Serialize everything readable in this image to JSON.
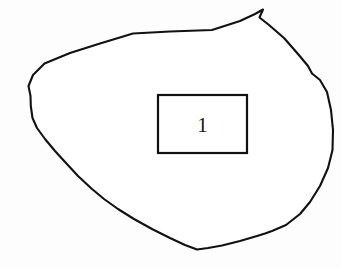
{
  "figure": {
    "kind": "hand-drawn-closed-outline-with-labelled-box",
    "background_color": "#fdfdfd",
    "stroke_color": "#111111",
    "fill_color": "#ffffff",
    "canvas": {
      "width": 341,
      "height": 268
    },
    "outline": {
      "name": "irregular-blob-outline",
      "stroke_width": 2.1,
      "closed": true,
      "description": "Irregular hand-drawn closed contour occupying most of the frame, with a sharp notch at the upper right",
      "path": "M 44.5 63.5 L 70 53 L 100 43.5 L 133 33.5 L 170 31.5 L 212 30 L 240 21 L 255 14 L 263 9.5 L 261 14 L 259.5 17.5 L 269 25 L 284 38 L 298 54 L 308 66 L 312 73.5 L 320 80 L 327 92 L 331 110 L 333 130 L 332.5 150 L 328 168 L 320 186 L 310 202 L 300 214 L 286 225 L 272 231 L 265 233.5 L 257 236 L 240 241 L 222 245.5 L 208 248 L 197 249.5 L 185 245 L 170 238 L 152 229 L 134 219 L 118 209 L 104 199 L 92 189 L 78 176 L 66 163 L 55 151 L 45 139 L 37 128 L 32.5 118 L 30.8 106 L 30.5 96 L 28.5 86 L 33 75 Z"
    },
    "callout_box": {
      "name": "numbered-callout-box",
      "x": 158,
      "y": 95,
      "width": 89,
      "height": 58,
      "stroke_width": 2.2,
      "label": "1",
      "label_font_size": 21
    }
  }
}
